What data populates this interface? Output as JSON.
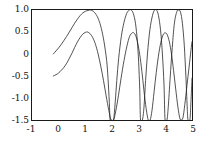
{
  "chart_data": {
    "type": "line",
    "title": "",
    "xlabel": "",
    "ylabel": "",
    "xlim": [
      -1,
      5
    ],
    "ylim": [
      -1.5,
      1.0
    ],
    "grid": false,
    "legend": null,
    "xticks": [
      -1,
      0,
      1,
      2,
      3,
      4,
      5
    ],
    "xticklabels": [
      "-1",
      "0",
      "1",
      "2",
      "3",
      "4",
      "5"
    ],
    "yticks": [
      -1.5,
      -1.0,
      -0.5,
      0,
      0.5,
      1.0
    ],
    "yticklabels": [
      "-1.5",
      "-1.0",
      "-0.5",
      "0",
      "0.5",
      "1.0"
    ],
    "line_color": "#1a1a1a",
    "series": [
      {
        "name": "curve-large-amplitude",
        "amplitude": 1.0,
        "points": [
          [
            -0.2,
            0.0
          ],
          [
            -0.1,
            0.07
          ],
          [
            0.0,
            0.14
          ],
          [
            0.1,
            0.22
          ],
          [
            0.2,
            0.31
          ],
          [
            0.3,
            0.4
          ],
          [
            0.4,
            0.5
          ],
          [
            0.5,
            0.6
          ],
          [
            0.6,
            0.7
          ],
          [
            0.7,
            0.79
          ],
          [
            0.8,
            0.87
          ],
          [
            0.9,
            0.93
          ],
          [
            1.0,
            0.97
          ],
          [
            1.1,
            0.99
          ],
          [
            1.2,
            1.0
          ],
          [
            1.3,
            0.97
          ],
          [
            1.4,
            0.9
          ],
          [
            1.5,
            0.78
          ],
          [
            1.6,
            0.58
          ],
          [
            1.7,
            0.28
          ],
          [
            1.8,
            -0.15
          ],
          [
            1.85,
            -0.55
          ],
          [
            1.9,
            -1.1
          ],
          [
            1.93,
            -1.5
          ],
          [
            2.0,
            -1.5
          ],
          [
            2.06,
            -1.5
          ],
          [
            2.12,
            -1.1
          ],
          [
            2.18,
            -0.6
          ],
          [
            2.25,
            -0.1
          ],
          [
            2.35,
            0.4
          ],
          [
            2.45,
            0.72
          ],
          [
            2.55,
            0.92
          ],
          [
            2.65,
            1.0
          ],
          [
            2.72,
            1.0
          ],
          [
            2.8,
            0.92
          ],
          [
            2.88,
            0.7
          ],
          [
            2.95,
            0.3
          ],
          [
            3.0,
            -0.2
          ],
          [
            3.04,
            -0.8
          ],
          [
            3.07,
            -1.5
          ],
          [
            3.14,
            -1.5
          ],
          [
            3.2,
            -1.2
          ],
          [
            3.26,
            -0.6
          ],
          [
            3.33,
            0.0
          ],
          [
            3.42,
            0.55
          ],
          [
            3.52,
            0.88
          ],
          [
            3.6,
            1.0
          ],
          [
            3.67,
            1.0
          ],
          [
            3.74,
            0.88
          ],
          [
            3.82,
            0.55
          ],
          [
            3.89,
            0.0
          ],
          [
            3.95,
            -0.7
          ],
          [
            3.99,
            -1.5
          ],
          [
            4.06,
            -1.5
          ],
          [
            4.11,
            -1.2
          ],
          [
            4.18,
            -0.55
          ],
          [
            4.26,
            0.15
          ],
          [
            4.34,
            0.7
          ],
          [
            4.43,
            0.96
          ],
          [
            4.5,
            1.0
          ],
          [
            4.57,
            0.95
          ],
          [
            4.64,
            0.7
          ],
          [
            4.71,
            0.2
          ],
          [
            4.77,
            -0.5
          ],
          [
            4.82,
            -1.2
          ],
          [
            4.85,
            -1.5
          ],
          [
            4.92,
            -1.5
          ],
          [
            4.96,
            -1.1
          ],
          [
            5.0,
            -0.55
          ]
        ]
      },
      {
        "name": "curve-small-amplitude",
        "amplitude": 0.5,
        "points": [
          [
            -0.2,
            -0.5
          ],
          [
            -0.1,
            -0.47
          ],
          [
            0.0,
            -0.43
          ],
          [
            0.1,
            -0.37
          ],
          [
            0.2,
            -0.3
          ],
          [
            0.3,
            -0.21
          ],
          [
            0.4,
            -0.1
          ],
          [
            0.5,
            0.02
          ],
          [
            0.6,
            0.15
          ],
          [
            0.7,
            0.27
          ],
          [
            0.8,
            0.37
          ],
          [
            0.9,
            0.45
          ],
          [
            1.0,
            0.49
          ],
          [
            1.08,
            0.5
          ],
          [
            1.18,
            0.46
          ],
          [
            1.28,
            0.37
          ],
          [
            1.38,
            0.22
          ],
          [
            1.48,
            0.0
          ],
          [
            1.58,
            -0.28
          ],
          [
            1.68,
            -0.6
          ],
          [
            1.78,
            -0.95
          ],
          [
            1.88,
            -1.28
          ],
          [
            1.95,
            -1.48
          ],
          [
            1.99,
            -1.5
          ],
          [
            2.06,
            -1.5
          ],
          [
            2.14,
            -1.3
          ],
          [
            2.24,
            -0.95
          ],
          [
            2.34,
            -0.55
          ],
          [
            2.45,
            -0.15
          ],
          [
            2.56,
            0.18
          ],
          [
            2.66,
            0.4
          ],
          [
            2.76,
            0.48
          ],
          [
            2.82,
            0.48
          ],
          [
            2.9,
            0.4
          ],
          [
            2.98,
            0.2
          ],
          [
            3.06,
            -0.1
          ],
          [
            3.14,
            -0.5
          ],
          [
            3.22,
            -0.95
          ],
          [
            3.3,
            -1.32
          ],
          [
            3.36,
            -1.5
          ],
          [
            3.43,
            -1.5
          ],
          [
            3.5,
            -1.28
          ],
          [
            3.58,
            -0.85
          ],
          [
            3.66,
            -0.42
          ],
          [
            3.74,
            -0.05
          ],
          [
            3.83,
            0.26
          ],
          [
            3.92,
            0.44
          ],
          [
            4.0,
            0.48
          ],
          [
            4.07,
            0.44
          ],
          [
            4.15,
            0.28
          ],
          [
            4.23,
            0.0
          ],
          [
            4.31,
            -0.38
          ],
          [
            4.39,
            -0.8
          ],
          [
            4.47,
            -1.2
          ],
          [
            4.54,
            -1.45
          ],
          [
            4.59,
            -1.5
          ],
          [
            4.66,
            -1.45
          ],
          [
            4.73,
            -1.15
          ],
          [
            4.81,
            -0.72
          ],
          [
            4.89,
            -0.3
          ],
          [
            4.96,
            0.08
          ],
          [
            5.0,
            0.28
          ]
        ]
      }
    ]
  }
}
